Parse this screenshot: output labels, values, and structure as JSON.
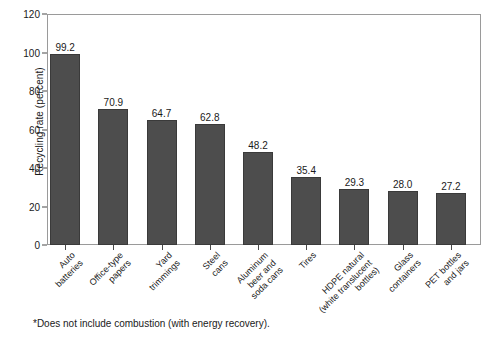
{
  "chart_data": {
    "type": "bar",
    "title": "",
    "xlabel": "",
    "ylabel": "Recycling rate (percent)",
    "ylim": [
      0,
      120
    ],
    "yticks": [
      0,
      20,
      40,
      60,
      80,
      100,
      120
    ],
    "grid": false,
    "legend": "none",
    "categories": [
      "Auto\nbatteries",
      "Office-type\npapers",
      "Yard\ntrimmings",
      "Steel\ncans",
      "Aluminum\nbeer and\nsoda cans",
      "Tires",
      "HDPE natural\n(white translucent\nbottles)",
      "Glass\ncontainers",
      "PET bottles\nand jars"
    ],
    "values": [
      99.2,
      70.9,
      64.7,
      62.8,
      48.2,
      35.4,
      29.3,
      28.0,
      27.2
    ],
    "value_labels": [
      "99.2",
      "70.9",
      "64.7",
      "62.8",
      "48.2",
      "35.4",
      "29.3",
      "28.0",
      "27.2"
    ],
    "footnote": "*Does not include combustion (with energy recovery).",
    "bar_color": "#4d4d4d",
    "axis_color": "#9a9a9a",
    "background_color": "#ffffff"
  },
  "yticklabels": [
    "0",
    "20",
    "40",
    "60",
    "80",
    "100",
    "120"
  ]
}
